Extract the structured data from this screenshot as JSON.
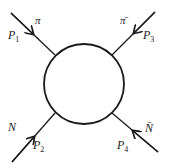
{
  "diagram": {
    "type": "scattering-vertex",
    "blob": {
      "shape": "circle",
      "cx": 84,
      "cy": 84,
      "r": 40
    },
    "legs": [
      {
        "id": "top-left",
        "particle": "π",
        "momentum_symbol": "P",
        "momentum_index": "1",
        "direction": "incoming"
      },
      {
        "id": "top-right",
        "particle": "π̄",
        "momentum_symbol": "P",
        "momentum_index": "3",
        "direction": "incoming"
      },
      {
        "id": "bottom-left",
        "particle": "N",
        "momentum_symbol": "P",
        "momentum_index": "2",
        "direction": "incoming"
      },
      {
        "id": "bottom-right",
        "particle": "N̄",
        "momentum_symbol": "P",
        "momentum_index": "4",
        "direction": "incoming"
      }
    ],
    "colors": {
      "stroke": "#1a1a1a",
      "background": "#ffffff"
    }
  }
}
